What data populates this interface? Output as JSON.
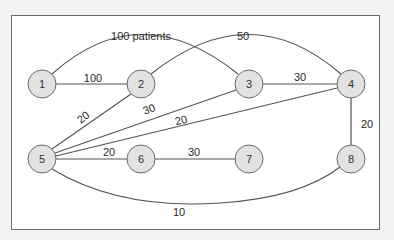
{
  "diagram": {
    "type": "network graph",
    "nodes": [
      {
        "id": "1",
        "label": "1",
        "x": 42,
        "y": 84
      },
      {
        "id": "2",
        "label": "2",
        "x": 141,
        "y": 84
      },
      {
        "id": "3",
        "label": "3",
        "x": 249,
        "y": 84
      },
      {
        "id": "4",
        "label": "4",
        "x": 351,
        "y": 84
      },
      {
        "id": "5",
        "label": "5",
        "x": 42,
        "y": 159
      },
      {
        "id": "6",
        "label": "6",
        "x": 141,
        "y": 159
      },
      {
        "id": "7",
        "label": "7",
        "x": 249,
        "y": 159
      },
      {
        "id": "8",
        "label": "8",
        "x": 351,
        "y": 159
      }
    ],
    "edges": [
      {
        "from": "1",
        "to": "3",
        "label": "100 patients"
      },
      {
        "from": "1",
        "to": "2",
        "label": "100"
      },
      {
        "from": "2",
        "to": "4",
        "label": "50"
      },
      {
        "from": "3",
        "to": "4",
        "label": "30"
      },
      {
        "from": "5",
        "to": "2",
        "label": "20"
      },
      {
        "from": "5",
        "to": "3",
        "label": "30"
      },
      {
        "from": "5",
        "to": "4",
        "label": "20"
      },
      {
        "from": "4",
        "to": "8",
        "label": "20"
      },
      {
        "from": "5",
        "to": "6",
        "label": "20"
      },
      {
        "from": "6",
        "to": "7",
        "label": "30"
      },
      {
        "from": "5",
        "to": "8",
        "label": "10"
      }
    ]
  }
}
